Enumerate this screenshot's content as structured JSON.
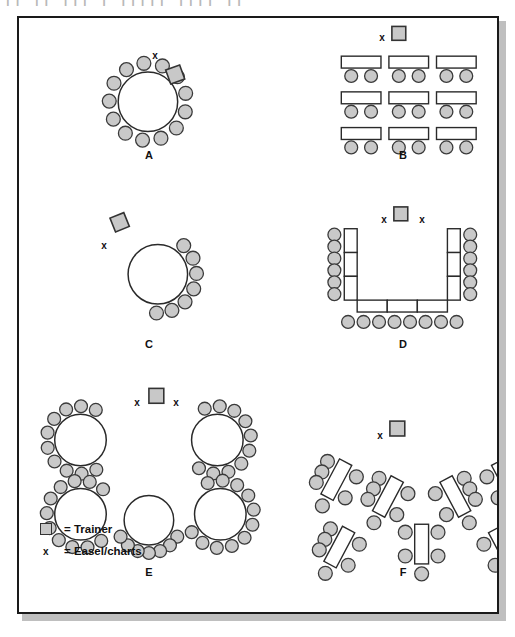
{
  "figure": {
    "title_ghost": "|| || ||| | ||||| |||| ||",
    "background": "#ffffff",
    "border_color": "#1a1a1a",
    "shadow_color": "#bfbfbf"
  },
  "style": {
    "chair_fill": "#c9c9c9",
    "chair_stroke": "#3a3a3a",
    "table_fill": "#ffffff",
    "table_stroke": "#2a2a2a",
    "trainer_fill": "#c8c8c8",
    "trainer_stroke": "#333333"
  },
  "legend": {
    "rows": [
      {
        "key": "trainer-swatch",
        "symbol": "",
        "text": "= Trainer"
      },
      {
        "key": "easel-x",
        "symbol": "x",
        "text": "= Easel/charts"
      }
    ]
  },
  "configurations": [
    {
      "id": "A",
      "label": "A",
      "name": "full-circle",
      "description": "Single round table with chairs all around and trainer seated in the circle",
      "label_pos": {
        "x": 130,
        "y": 131
      },
      "easel_marks": [
        {
          "x": 136,
          "y": 32
        }
      ],
      "trainer": {
        "x": 150,
        "y": 49,
        "w": 15,
        "h": 15,
        "rotate": -20
      },
      "round_tables": [
        {
          "cx": 130,
          "cy": 84,
          "r": 30,
          "chairs": 13,
          "chair_r": 7,
          "chair_orbit": 39,
          "start_angle": -68,
          "sweep": 332
        }
      ]
    },
    {
      "id": "B",
      "label": "B",
      "name": "classroom-style",
      "description": "Three by three grid of rectangular tables each seating two, all facing the trainer",
      "label_pos": {
        "x": 384,
        "y": 131
      },
      "easel_marks": [
        {
          "x": 363,
          "y": 14
        }
      ],
      "trainer": {
        "x": 376,
        "y": 8,
        "w": 14,
        "h": 14,
        "rotate": 0
      },
      "classroom": {
        "cols": 3,
        "rows": 3,
        "origin_x": 325,
        "origin_y": 38,
        "col_gap": 48,
        "row_gap": 36,
        "table_w": 40,
        "table_h": 12,
        "chair_r": 6.5,
        "chair_dx": 10,
        "chair_dy": 20
      }
    },
    {
      "id": "C",
      "label": "C",
      "name": "horseshoe-circle",
      "description": "Round table with chairs on the far arc only, trainer and easel off to one side",
      "label_pos": {
        "x": 130,
        "y": 320
      },
      "easel_marks": [
        {
          "x": 85,
          "y": 222
        }
      ],
      "trainer": {
        "x": 94,
        "y": 198,
        "w": 15,
        "h": 15,
        "rotate": -22
      },
      "round_tables": [
        {
          "cx": 140,
          "cy": 258,
          "r": 30,
          "chairs": 7,
          "chair_r": 7,
          "chair_orbit": 39,
          "start_angle": -48,
          "sweep": 140
        }
      ]
    },
    {
      "id": "D",
      "label": "D",
      "name": "u-shape",
      "description": "U shaped arrangement of tables with chairs on the outside of the U",
      "label_pos": {
        "x": 384,
        "y": 320
      },
      "easel_marks": [
        {
          "x": 365,
          "y": 196
        },
        {
          "x": 403,
          "y": 196
        }
      ],
      "trainer": {
        "x": 378,
        "y": 190,
        "w": 14,
        "h": 14,
        "rotate": 0
      },
      "ushape": {
        "left_x": 328,
        "right_x": 432,
        "top_y": 212,
        "bottom_y": 284,
        "arm_w": 13,
        "base_h": 12,
        "side_segments": 3,
        "base_segments": 3,
        "side_chairs": 6,
        "bottom_chairs": 8,
        "chair_r": 6.5
      }
    },
    {
      "id": "E",
      "label": "E",
      "name": "rounds-banquet",
      "description": "Five round tables, crescent seating with open side toward the trainer",
      "label_pos": {
        "x": 130,
        "y": 548
      },
      "easel_marks": [
        {
          "x": 118,
          "y": 379
        },
        {
          "x": 157,
          "y": 379
        }
      ],
      "trainer": {
        "x": 131,
        "y": 373,
        "w": 15,
        "h": 15,
        "rotate": 0
      },
      "round_tables": [
        {
          "cx": 62,
          "cy": 425,
          "r": 26,
          "chairs": 10,
          "chair_r": 6.5,
          "chair_orbit": 34,
          "start_angle": 62,
          "sweep": 235
        },
        {
          "cx": 200,
          "cy": 425,
          "r": 26,
          "chairs": 10,
          "chair_r": 6.5,
          "chair_orbit": 34,
          "start_angle": 248,
          "sweep": 235
        },
        {
          "cx": 62,
          "cy": 500,
          "r": 26,
          "chairs": 11,
          "chair_r": 6.5,
          "chair_orbit": 34,
          "start_angle": 52,
          "sweep": 260
        },
        {
          "cx": 131,
          "cy": 506,
          "r": 25,
          "chairs": 7,
          "chair_r": 6.5,
          "chair_orbit": 33,
          "start_angle": 30,
          "sweep": 120
        },
        {
          "cx": 203,
          "cy": 500,
          "r": 26,
          "chairs": 11,
          "chair_r": 6.5,
          "chair_orbit": 34,
          "start_angle": 248,
          "sweep": 260
        }
      ]
    },
    {
      "id": "F",
      "label": "F",
      "name": "herringbone-chevron",
      "description": "Seven rectangular tables angled in a chevron toward the trainer",
      "label_pos": {
        "x": 384,
        "y": 548
      },
      "easel_marks": [
        {
          "x": 361,
          "y": 412
        }
      ],
      "trainer": {
        "x": 374,
        "y": 406,
        "w": 15,
        "h": 15,
        "rotate": 0
      },
      "angled_tables": [
        {
          "cx": 320,
          "cy": 465,
          "rotate": 28,
          "chairs_left": 3,
          "chairs_right": 2,
          "chairs_end": 1
        },
        {
          "cx": 372,
          "cy": 482,
          "rotate": 28,
          "chairs_left": 3,
          "chairs_right": 2,
          "chairs_end": 1
        },
        {
          "cx": 440,
          "cy": 482,
          "rotate": -28,
          "chairs_left": 2,
          "chairs_right": 3,
          "chairs_end": 1
        },
        {
          "cx": 492,
          "cy": 465,
          "rotate": -28,
          "chairs_left": 2,
          "chairs_right": 3,
          "chairs_end": 1
        },
        {
          "cx": 323,
          "cy": 533,
          "rotate": 28,
          "chairs_left": 3,
          "chairs_right": 2,
          "chairs_end": 1
        },
        {
          "cx": 406,
          "cy": 530,
          "rotate": 0,
          "chairs_left": 2,
          "chairs_right": 2,
          "chairs_end": 1
        },
        {
          "cx": 489,
          "cy": 533,
          "rotate": -28,
          "chairs_left": 2,
          "chairs_right": 3,
          "chairs_end": 1
        }
      ],
      "table_w": 14,
      "table_h": 40,
      "chair_r": 7
    }
  ]
}
